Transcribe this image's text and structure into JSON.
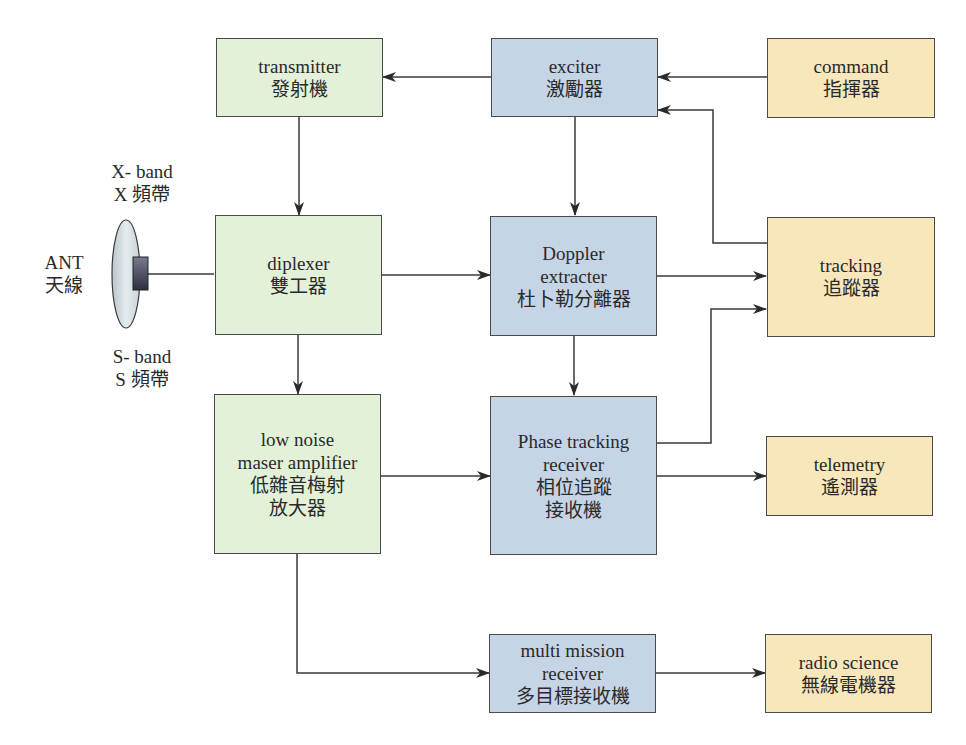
{
  "diagram": {
    "antenna": {
      "en": "ANT",
      "zh": "天線"
    },
    "x_band": {
      "en": "X- band",
      "zh": "X 頻帶"
    },
    "s_band": {
      "en": "S- band",
      "zh": "S 頻帶"
    },
    "blocks": {
      "transmitter": {
        "en": "transmitter",
        "zh": "發射機"
      },
      "exciter": {
        "en": "exciter",
        "zh": "激勵器"
      },
      "command": {
        "en": "command",
        "zh": "指揮器"
      },
      "diplexer": {
        "en": "diplexer",
        "zh": "雙工器"
      },
      "doppler": {
        "en1": "Doppler",
        "en2": "extracter",
        "zh": "杜卜勒分離器"
      },
      "tracking": {
        "en": "tracking",
        "zh": "追蹤器"
      },
      "lna": {
        "en1": "low noise",
        "en2": "maser amplifier",
        "zh1": "低雜音梅射",
        "zh2": "放大器"
      },
      "ptr": {
        "en1": "Phase tracking",
        "en2": "receiver",
        "zh1": "相位追蹤",
        "zh2": "接收機"
      },
      "telemetry": {
        "en": "telemetry",
        "zh": "遙測器"
      },
      "mmr": {
        "en1": "multi mission",
        "en2": "receiver",
        "zh": "多目標接收機"
      },
      "radio_science": {
        "en": "radio science",
        "zh": "無線電機器"
      }
    },
    "colors": {
      "rf_block": "#e3f1d8",
      "processing_block": "#c6d5e6",
      "output_block": "#f9e7bc",
      "line": "#3a3a3a"
    },
    "connections": [
      {
        "from": "exciter",
        "to": "transmitter"
      },
      {
        "from": "command",
        "to": "exciter"
      },
      {
        "from": "tracking",
        "to": "exciter"
      },
      {
        "from": "transmitter",
        "to": "diplexer"
      },
      {
        "from": "exciter",
        "to": "doppler"
      },
      {
        "from": "antenna",
        "to": "diplexer"
      },
      {
        "from": "diplexer",
        "to": "doppler"
      },
      {
        "from": "doppler",
        "to": "tracking"
      },
      {
        "from": "diplexer",
        "to": "lna"
      },
      {
        "from": "doppler",
        "to": "ptr"
      },
      {
        "from": "ptr",
        "to": "tracking"
      },
      {
        "from": "lna",
        "to": "ptr"
      },
      {
        "from": "ptr",
        "to": "telemetry"
      },
      {
        "from": "lna",
        "to": "mmr"
      },
      {
        "from": "mmr",
        "to": "radio_science"
      }
    ]
  }
}
